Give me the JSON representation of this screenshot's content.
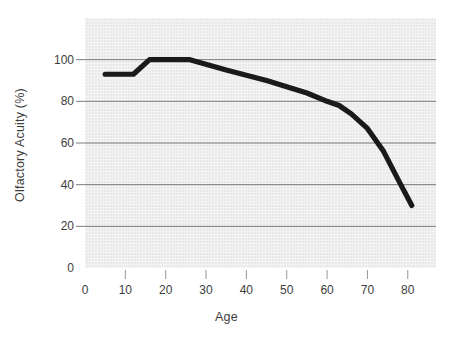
{
  "chart_data": {
    "type": "line",
    "title": "",
    "xlabel": "Age",
    "ylabel": "Olfactory Acuity (%)",
    "xlim": [
      0,
      87
    ],
    "ylim": [
      0,
      120
    ],
    "grid": "horizontal",
    "legend": "none",
    "line_color": "#1a1a1a",
    "plot_background": "#e9e9e9",
    "x_ticks": [
      0,
      10,
      20,
      30,
      40,
      50,
      60,
      70,
      80
    ],
    "x_tick_labels": [
      "0",
      "10",
      "20",
      "30",
      "40",
      "50",
      "60",
      "70",
      "80"
    ],
    "y_ticks": [
      0,
      20,
      40,
      60,
      80,
      100
    ],
    "y_tick_labels": [
      "0",
      "20",
      "40",
      "60",
      "80",
      "100"
    ],
    "series": [
      {
        "name": "Olfactory Acuity",
        "x": [
          5,
          12,
          16,
          26,
          35,
          45,
          55,
          60,
          63,
          66,
          70,
          74,
          78,
          81
        ],
        "values": [
          93,
          93,
          100,
          100,
          95,
          90,
          84,
          80,
          78,
          74,
          67,
          56,
          41,
          30
        ]
      }
    ]
  }
}
